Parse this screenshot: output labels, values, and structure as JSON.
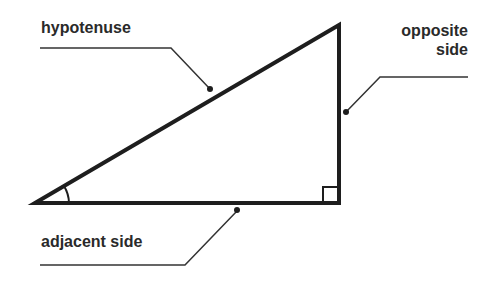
{
  "diagram": {
    "labels": {
      "hypotenuse": "hypotenuse",
      "opposite_line1": "opposite",
      "opposite_line2": "side",
      "adjacent": "adjacent side"
    },
    "colors": {
      "stroke": "#1e1e1e",
      "leader": "#333333",
      "text": "#2a2a2a",
      "background": "#ffffff"
    }
  }
}
